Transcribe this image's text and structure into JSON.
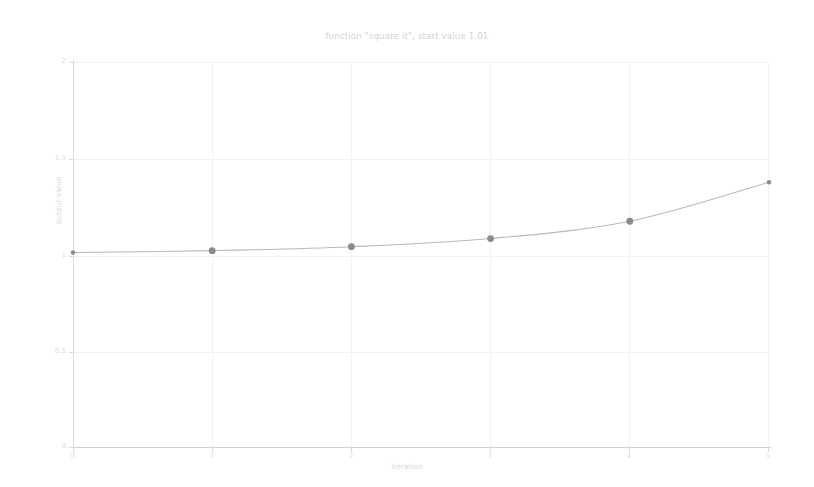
{
  "chart_data": {
    "type": "line",
    "title": "function \"square it\", start value 1.01",
    "xlabel": "iteration",
    "ylabel": "output value",
    "x": [
      0,
      1,
      2,
      3,
      4,
      5
    ],
    "values": [
      1.01,
      1.0201,
      1.0406,
      1.0829,
      1.1727,
      1.3752
    ],
    "series": [
      {
        "name": "square it",
        "values": [
          1.01,
          1.0201,
          1.0406,
          1.0829,
          1.1727,
          1.3752
        ]
      }
    ],
    "xlim": [
      0,
      5
    ],
    "ylim": [
      0,
      2
    ],
    "xticks": [
      "0",
      "1",
      "2",
      "3",
      "4",
      "5"
    ],
    "yticks": [
      "0",
      "0.5",
      "1",
      "1.5",
      "2"
    ],
    "grid": true,
    "legend": "none",
    "marker": "circle",
    "line_color": "#b9b9bf",
    "marker_color": "#8a8a90",
    "grid_color": "#f2f2f4",
    "axis_color": "#d9d9dd",
    "text_color": "#d8d8dc",
    "background": "#ffffff"
  }
}
